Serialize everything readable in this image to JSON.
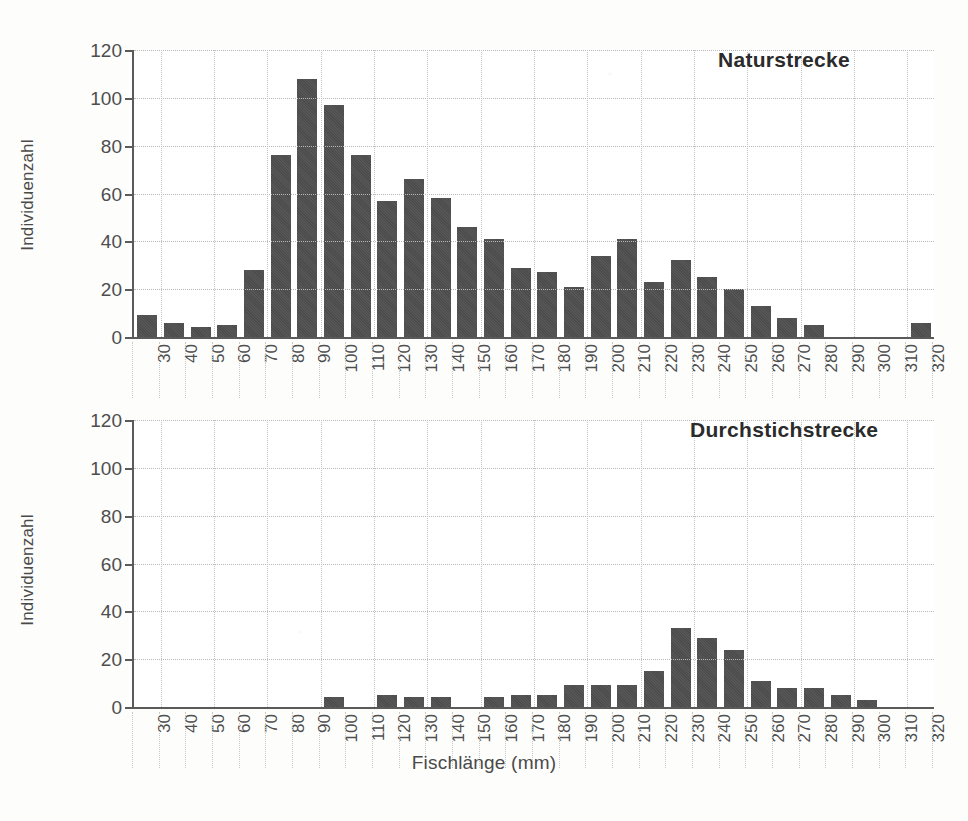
{
  "figure": {
    "xaxis_title": "Fischlänge (mm)",
    "yaxis_title": "Individuenzahl"
  },
  "chart_data": [
    {
      "type": "bar",
      "title": "Naturstrecke",
      "xlabel": "Fischlänge (mm)",
      "ylabel": "Individuenzahl",
      "ylim": [
        0,
        120
      ],
      "yticks": [
        0,
        20,
        40,
        60,
        80,
        100,
        120
      ],
      "grid": true,
      "legend": "none",
      "categories": [
        30,
        40,
        50,
        60,
        70,
        80,
        90,
        100,
        110,
        120,
        130,
        140,
        150,
        160,
        170,
        180,
        190,
        200,
        210,
        220,
        230,
        240,
        250,
        260,
        270,
        280,
        290,
        300,
        310,
        320
      ],
      "values": [
        9,
        6,
        4,
        5,
        28,
        76,
        108,
        97,
        76,
        57,
        66,
        58,
        46,
        41,
        29,
        27,
        21,
        34,
        41,
        23,
        32,
        25,
        20,
        13,
        8,
        5,
        0,
        0,
        0,
        6
      ]
    },
    {
      "type": "bar",
      "title": "Durchstichstrecke",
      "xlabel": "Fischlänge (mm)",
      "ylabel": "Individuenzahl",
      "ylim": [
        0,
        120
      ],
      "yticks": [
        0,
        20,
        40,
        60,
        80,
        100,
        120
      ],
      "grid": true,
      "legend": "none",
      "categories": [
        30,
        40,
        50,
        60,
        70,
        80,
        90,
        100,
        110,
        120,
        130,
        140,
        150,
        160,
        170,
        180,
        190,
        200,
        210,
        220,
        230,
        240,
        250,
        260,
        270,
        280,
        290,
        300,
        310,
        320
      ],
      "values": [
        0,
        0,
        0,
        0,
        0,
        0,
        0,
        4,
        0,
        5,
        4,
        4,
        0,
        4,
        5,
        5,
        9,
        9,
        9,
        15,
        33,
        29,
        24,
        11,
        8,
        8,
        5,
        3,
        0,
        0
      ]
    }
  ],
  "colors": {
    "bar": "#4c4c4c",
    "axis": "#5a5a5a",
    "grid": "#b9b9b9",
    "text": "#4a4a4a",
    "title": "#2b2b2b",
    "background": "#fdfdfc"
  }
}
